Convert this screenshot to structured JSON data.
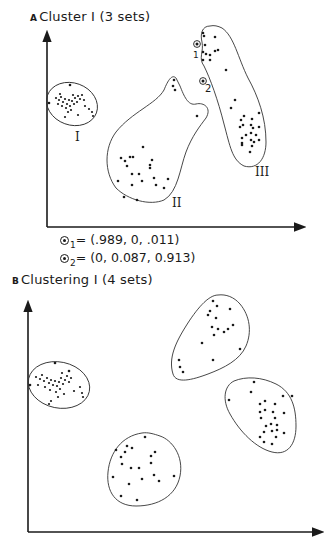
{
  "panel_a": {
    "letter": "A",
    "title": "Cluster I  (3 sets)",
    "cluster_labels": [
      "I",
      "II",
      "III"
    ],
    "special_points": [
      {
        "label": "1",
        "membership": "(.989, 0, .011)"
      },
      {
        "label": "2",
        "membership": "(0, 0.087, 0.913)"
      }
    ]
  },
  "panel_b": {
    "letter": "B",
    "title": "Clustering I  (4 sets)"
  },
  "legend": {
    "line1_sub": "1",
    "line1_text": "= (.989, 0, .011)",
    "line2_sub": "2",
    "line2_text": "= (0, 0.087, 0.913)"
  },
  "colors": {
    "ink": "#1a1a1a",
    "background": "#ffffff"
  }
}
